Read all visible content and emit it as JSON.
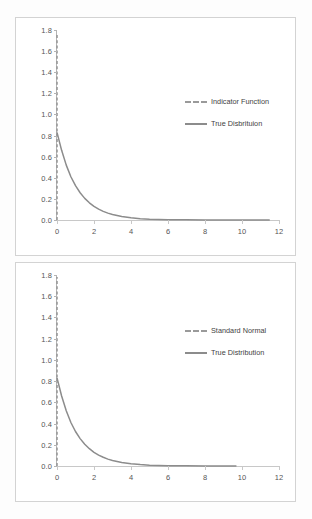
{
  "chart_data": [
    {
      "id": "top",
      "type": "line",
      "title": "",
      "xlabel": "",
      "ylabel": "",
      "xlim": [
        0,
        12
      ],
      "ylim": [
        0.0,
        1.8
      ],
      "xticks": [
        "0",
        "2",
        "4",
        "6",
        "8",
        "10",
        "12"
      ],
      "xtick_values": [
        0,
        2,
        4,
        6,
        8,
        10,
        12
      ],
      "yticks": [
        "0.0",
        "0.2",
        "0.4",
        "0.6",
        "0.8",
        "1.0",
        "1.2",
        "1.4",
        "1.6",
        "1.8"
      ],
      "ytick_values": [
        0.0,
        0.2,
        0.4,
        0.6,
        0.8,
        1.0,
        1.2,
        1.4,
        1.6,
        1.8
      ],
      "grid": false,
      "legend_position": "center-right",
      "series": [
        {
          "name": "Indicator Function",
          "style": "dashed",
          "color": "#9a9a9a",
          "x": [
            0,
            0
          ],
          "values": [
            0.0,
            1.77
          ]
        },
        {
          "name": "True Disbrituion",
          "style": "solid",
          "color": "#8c8c8c",
          "x": [
            0,
            0.25,
            0.5,
            0.75,
            1.0,
            1.25,
            1.5,
            1.75,
            2.0,
            2.25,
            2.5,
            2.75,
            3.0,
            3.5,
            4.0,
            4.5,
            5.0,
            5.5,
            6.0,
            7.0,
            8.0,
            9.0,
            10.0,
            11.0,
            11.5
          ],
          "values": [
            0.83,
            0.66,
            0.52,
            0.41,
            0.325,
            0.258,
            0.205,
            0.163,
            0.129,
            0.103,
            0.082,
            0.065,
            0.052,
            0.033,
            0.021,
            0.013,
            0.008,
            0.005,
            0.0035,
            0.0015,
            0.0007,
            0.0003,
            0.0002,
            0.0001,
            0.0
          ]
        }
      ]
    },
    {
      "id": "bottom",
      "type": "line",
      "title": "",
      "xlabel": "",
      "ylabel": "",
      "xlim": [
        0,
        12
      ],
      "ylim": [
        0.0,
        1.8
      ],
      "xticks": [
        "0",
        "2",
        "4",
        "6",
        "8",
        "10",
        "12"
      ],
      "xtick_values": [
        0,
        2,
        4,
        6,
        8,
        10,
        12
      ],
      "yticks": [
        "0.0",
        "0.2",
        "0.4",
        "0.6",
        "0.8",
        "1.0",
        "1.2",
        "1.4",
        "1.6",
        "1.8"
      ],
      "ytick_values": [
        0.0,
        0.2,
        0.4,
        0.6,
        0.8,
        1.0,
        1.2,
        1.4,
        1.6,
        1.8
      ],
      "grid": false,
      "legend_position": "center-right",
      "series": [
        {
          "name": "Standard Normal",
          "style": "dashed",
          "color": "#9a9a9a",
          "x": [
            0,
            0
          ],
          "values": [
            0.0,
            1.78
          ]
        },
        {
          "name": "True Distribution",
          "style": "solid",
          "color": "#8c8c8c",
          "x": [
            0,
            0.25,
            0.5,
            0.75,
            1.0,
            1.25,
            1.5,
            1.75,
            2.0,
            2.25,
            2.5,
            2.75,
            3.0,
            3.5,
            4.0,
            4.5,
            5.0,
            5.5,
            6.0,
            7.0,
            8.0,
            9.0,
            9.7
          ],
          "values": [
            0.83,
            0.66,
            0.52,
            0.41,
            0.325,
            0.258,
            0.205,
            0.163,
            0.129,
            0.103,
            0.082,
            0.065,
            0.052,
            0.033,
            0.021,
            0.013,
            0.008,
            0.005,
            0.0035,
            0.0015,
            0.0007,
            0.0003,
            0.0
          ]
        }
      ]
    }
  ],
  "colors": {
    "dashed_series": "#9a9a9a",
    "solid_series": "#8c8c8c",
    "axis": "#b4b4b4",
    "panel_border": "#d3d3d3",
    "tick_text": "#555555"
  }
}
